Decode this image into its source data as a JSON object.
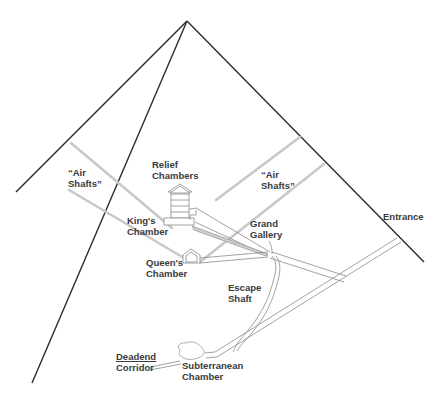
{
  "diagram": {
    "colors": {
      "outline": "#2b2b2b",
      "air_shaft": "#c8c8c8",
      "passage": "#8a8a8a",
      "label": "#3a3a3a",
      "background": "#ffffff"
    },
    "labels": {
      "air_shafts_left": {
        "line1": "“Air",
        "line2": "Shafts”"
      },
      "air_shafts_right": {
        "line1": "“Air",
        "line2": "Shafts”"
      },
      "relief_chambers": {
        "line1": "Relief",
        "line2": "Chambers"
      },
      "kings_chamber": {
        "line1": "King's",
        "line2": "Chamber"
      },
      "grand_gallery": {
        "line1": "Grand",
        "line2": "Gallery"
      },
      "entrance": {
        "line1": "Entrance"
      },
      "queens_chamber": {
        "line1": "Queen's",
        "line2": "Chamber"
      },
      "escape_shaft": {
        "line1": "Escape",
        "line2": "Shaft"
      },
      "deadend_corridor": {
        "line1": "Deadend",
        "line2": "Corridor"
      },
      "subterranean_chamber": {
        "line1": "Subterranean",
        "line2": "Chamber"
      }
    }
  }
}
